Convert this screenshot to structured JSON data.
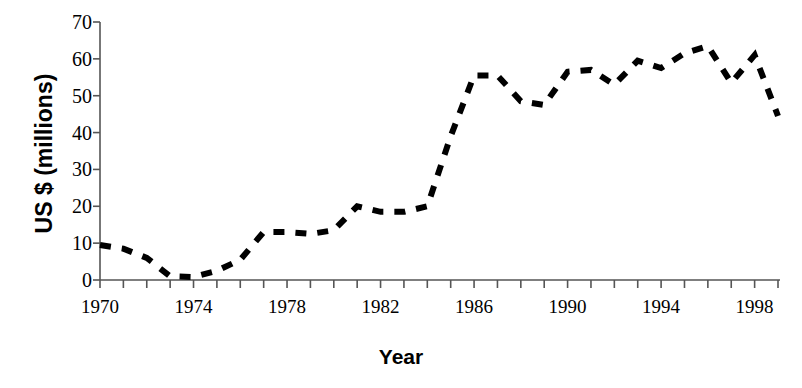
{
  "chart_data": {
    "type": "line",
    "title": "",
    "xlabel": "Year",
    "ylabel": "US $ (millions)",
    "xlim": [
      1970,
      1999
    ],
    "ylim": [
      0,
      70
    ],
    "grid": false,
    "legend": "none",
    "line_style": "dashed",
    "line_color": "#000000",
    "x": [
      1970,
      1971,
      1972,
      1973,
      1974,
      1975,
      1976,
      1977,
      1978,
      1979,
      1980,
      1981,
      1982,
      1983,
      1984,
      1985,
      1986,
      1987,
      1988,
      1989,
      1990,
      1991,
      1992,
      1993,
      1994,
      1995,
      1996,
      1997,
      1998,
      1999
    ],
    "values": [
      9.5,
      8.5,
      6.0,
      1.0,
      0.8,
      2.5,
      5.5,
      13.0,
      13.0,
      12.5,
      13.5,
      20.0,
      18.5,
      18.5,
      20.0,
      39.0,
      55.5,
      55.5,
      48.5,
      47.5,
      56.5,
      57.0,
      53.0,
      59.5,
      57.5,
      61.5,
      63.5,
      53.5,
      61.0,
      44.5
    ],
    "y_ticks": [
      0,
      10,
      20,
      30,
      40,
      50,
      60,
      70
    ],
    "x_tick_labels": [
      "1970",
      "1974",
      "1978",
      "1982",
      "1986",
      "1990",
      "1994",
      "1998"
    ],
    "x_tick_label_values": [
      1970,
      1974,
      1978,
      1982,
      1986,
      1990,
      1994,
      1998
    ],
    "x_minor_ticks_every": 1,
    "axis_color": "#555555"
  }
}
